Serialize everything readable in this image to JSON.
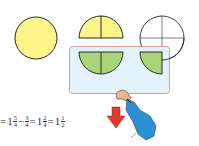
{
  "colors": {
    "yellow": "#fdf48a",
    "green": "#a9d67a",
    "box_fill": "#e4f3fb",
    "box_border": "#d99aa0",
    "outline": "#2a2a2a",
    "arrow_red": "#e03a2c",
    "sleeve_blue": "#2f8fd4"
  },
  "figures": {
    "whole_circle": {
      "label": "1 whole"
    },
    "half_circle": {
      "label": "top half, split in 2"
    },
    "outline_circle": {
      "label": "outline with quarter cross"
    }
  },
  "equation": {
    "lead": "=",
    "parts": [
      {
        "whole": "1",
        "num": "5",
        "den": "4"
      },
      {
        "op": "−"
      },
      {
        "whole": "",
        "num": "3",
        "den": "4"
      },
      {
        "op": "="
      },
      {
        "whole": "1",
        "num": "2",
        "den": "4"
      },
      {
        "op": "="
      },
      {
        "whole": "1",
        "num": "1",
        "den": "2"
      }
    ]
  }
}
